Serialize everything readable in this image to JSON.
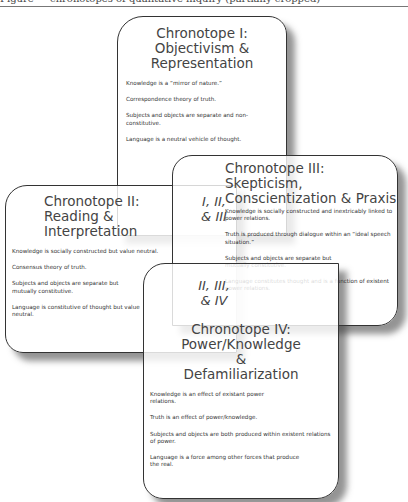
{
  "page_header": {
    "cut_off_text": "Figure — chronotopes of qualitative inquiry (partially cropped)"
  },
  "diagram": {
    "cards": [
      {
        "id": "I",
        "title_lines": [
          "Chronotope I:",
          "Objectivism &",
          "Representation"
        ],
        "statements": [
          "Knowledge is a “mirror of nature.”",
          "Correspondence theory of truth.",
          "Subjects and objects are separate and non-constitutive.",
          "Language is a neutral vehicle of thought."
        ]
      },
      {
        "id": "II",
        "title_lines": [
          "Chronotope II:",
          "Reading &",
          "Interpretation"
        ],
        "statements": [
          "Knowledge is socially constructed but value neutral.",
          "Consensus theory of truth.",
          "Subjects and objects are separate but mutually constitutive.",
          "Language is constitutive of thought but value neutral."
        ]
      },
      {
        "id": "III",
        "title_lines": [
          "Chronotope III:",
          "Skepticism,",
          "Conscientization & Praxis"
        ],
        "statements": [
          "Knowledge is socially constructed and inextricably linked to power relations.",
          "Truth is produced through dialogue within an “ideal speech situation.”",
          "Subjects and objects are separate but mutually constitutive.",
          "Language constitutes thought and is a function of existent power relations."
        ]
      },
      {
        "id": "IV",
        "title_lines": [
          "Chronotope IV:",
          "Power/Knowledge",
          "&",
          "Defamiliarization"
        ],
        "statements": [
          "Knowledge is an effect of existant power relations.",
          "Truth is an effect of power/knowledge.",
          "Subjects and objects are both produced within existent relations of power.",
          "Language is a force among other forces that produce the real."
        ]
      }
    ],
    "overlaps": [
      {
        "lines": [
          "I, II,",
          "& III"
        ]
      },
      {
        "lines": [
          "II, III,",
          "& IV"
        ]
      }
    ]
  }
}
